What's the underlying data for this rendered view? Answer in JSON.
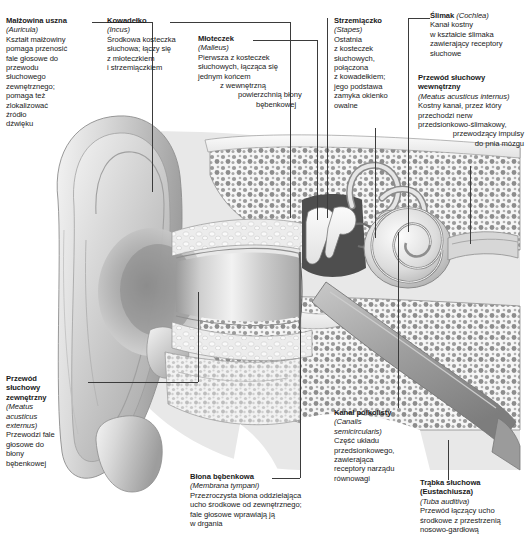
{
  "diagram": {
    "language": "pl",
    "ink_color": "#1a1a1a",
    "background": "#ffffff",
    "line_color": "#3b3b3b"
  },
  "labels": {
    "auricula": {
      "title": "Małżowina uszna",
      "latin": "(Auricula)",
      "lines": [
        "Kształt małżowiny",
        "pomaga przenosić",
        "fale głosowe do",
        "przewodu",
        "słuchowego",
        "zewnętrznego;",
        "pomaga też",
        "zlokalizować",
        "źródło",
        "dźwięku"
      ]
    },
    "incus": {
      "title": "Kowadełko",
      "latin": "(Incus)",
      "lines": [
        "Środkowa kosteczka",
        "słuchowa; łączy się",
        "z młoteczkiem",
        "i strzemiączkiem"
      ]
    },
    "malleus": {
      "title": "Młoteczek",
      "latin": "(Malleus)",
      "lines": [
        "Pierwsza z kosteczek",
        "słuchowych, łącząca się",
        "jednym końcem",
        "z wewnętrzną",
        "powierzchnią błony",
        "bębenkowej"
      ]
    },
    "stapes": {
      "title": "Strzemiączko",
      "latin": "(Stapes)",
      "lines": [
        "Ostatnia",
        "z kosteczek",
        "słuchowych,",
        "połączona",
        "z kowadełkiem;",
        "jego podstawa",
        "zamyka okienko",
        "owalne"
      ]
    },
    "cochlea": {
      "title": "Ślimak",
      "latin": "(Cochlea)",
      "lines": [
        "Kanał kostny",
        "w kształcie ślimaka",
        "zawierający receptory",
        "słuchowe"
      ]
    },
    "meatus_internus": {
      "title_line1": "Przewód słuchowy",
      "title_line2": "wewnętrzny",
      "latin": "(Meatus acusticus internus)",
      "lines": [
        "Kostny kanał, przez który",
        "przechodzi nerw",
        "przedsionkowo-ślimakowy,",
        "przewodzący impulsy",
        "do pnia mózgu"
      ]
    },
    "meatus_externus": {
      "title_line1": "Przewód",
      "title_line2": "słuchowy",
      "title_line3": "zewnętrzny",
      "latin_line1": "(Meatus",
      "latin_line2": "acusticus",
      "latin_line3": "externus)",
      "lines": [
        "Przewodzi fale",
        "głosowe do",
        "błony",
        "bębenkowej"
      ]
    },
    "membrana_tympani": {
      "title": "Błona bębenkowa",
      "latin": "(Membrana tympani)",
      "lines": [
        "Przezroczysta błona oddzielająca",
        "ucho środkowe od zewnętrznego;",
        "fale głosowe wprawiają ją",
        "w drgania"
      ]
    },
    "canalis_semicircularis": {
      "title": "Kanał półkolisty",
      "latin_line1": "(Canalis",
      "latin_line2": "semicircularis)",
      "lines": [
        "Część układu",
        "przedsionkowego,",
        "zawierająca",
        "receptory narządu",
        "równowagi"
      ]
    },
    "tuba_auditiva": {
      "title_line1": "Trąbka słuchowa",
      "title_line2": "(Eustachiusza)",
      "latin": "(Tuba auditiva)",
      "lines": [
        "Przewód łączący ucho",
        "środkowe z przestrzenią",
        "nosowo-gardłową"
      ]
    }
  },
  "illustration": {
    "name": "ear-anatomy-cross-section",
    "description": "Przekrój ucha: małżowina uszna, przewód słuchowy zewnętrzny, błona bębenkowa, kosteczki słuchowe, ślimak, kanały półkoliste, trąbka słuchowa",
    "style": "grayscale-medical-illustration"
  }
}
